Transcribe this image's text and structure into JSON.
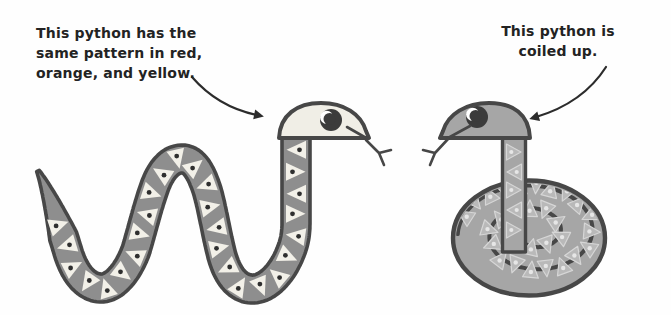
{
  "captions": {
    "left": {
      "lines": [
        "This python has the",
        "same pattern in red,",
        "orange, and yellow."
      ]
    },
    "right": {
      "lines": [
        "This python is",
        "coiled up."
      ]
    }
  },
  "figures": {
    "left_python": "wavy-python-with-triangle-pattern",
    "right_python": "coiled-python-with-triangle-pattern"
  },
  "colors": {
    "background": "#fefefe",
    "outline": "#474747",
    "arrow": "#2c2c2c",
    "text": "#232323",
    "left_body": "#8e8e8e",
    "left_triangle": "#f2f0e8",
    "left_dot": "#2f2f2f",
    "left_head": "#f0eee6",
    "right_body": "#a6a6a6",
    "right_triangle": "#b9b9b9",
    "right_triangle_edge": "#d6d6d6",
    "right_dot": "#e6e6e6",
    "eye_pupil": "#3b3b3b",
    "eye_highlight": "#ffffff"
  }
}
